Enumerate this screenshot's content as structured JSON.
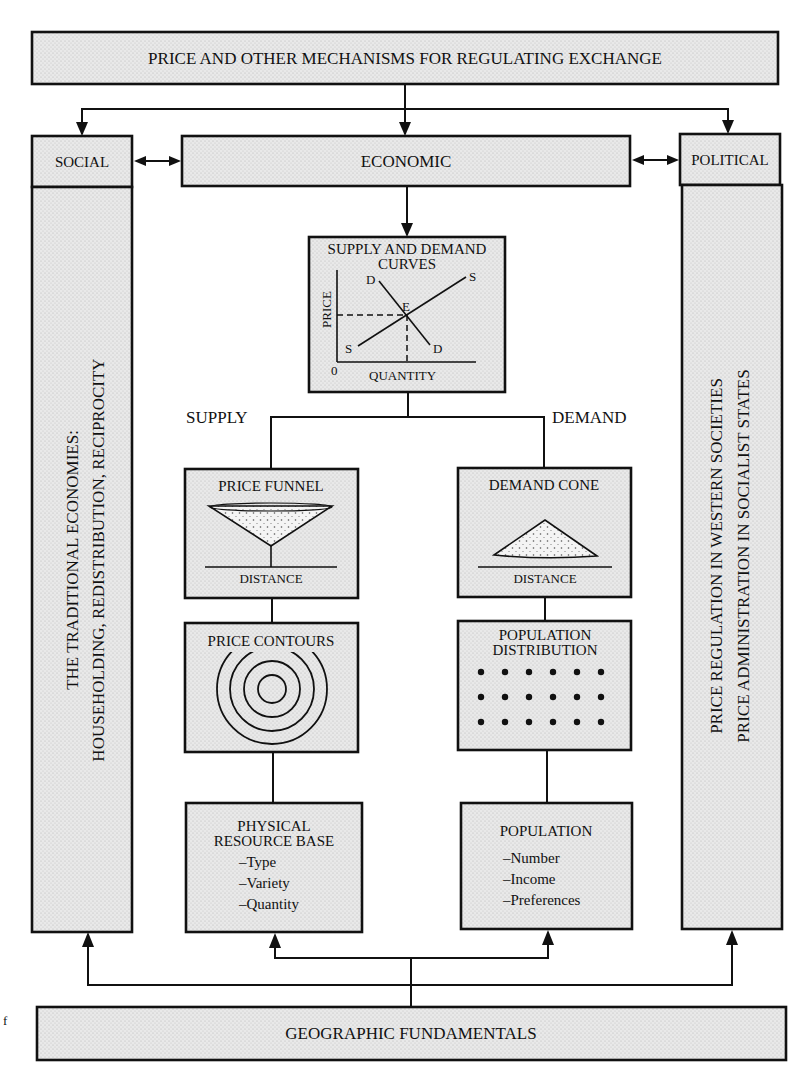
{
  "top_box": {
    "label": "PRICE AND OTHER MECHANISMS FOR REGULATING EXCHANGE"
  },
  "social": {
    "header": "SOCIAL",
    "body_line1": "THE TRADITIONAL ECONOMIES:",
    "body_line2": "HOUSEHOLDING, REDISTRIBUTION, RECIPROCITY"
  },
  "economic": {
    "label": "ECONOMIC"
  },
  "political": {
    "header": "POLITICAL",
    "body_line1": "PRICE REGULATION IN WESTERN SOCIETIES",
    "body_line2": "PRICE ADMINISTRATION IN SOCIALIST STATES"
  },
  "supply_demand": {
    "title_line1": "SUPPLY AND DEMAND",
    "title_line2": "CURVES",
    "y_axis_label": "PRICE",
    "x_axis_label": "QUANTITY",
    "origin_label": "0",
    "demand_label": "D",
    "supply_label": "S",
    "equilibrium_label": "E"
  },
  "branch_labels": {
    "supply": "SUPPLY",
    "demand": "DEMAND"
  },
  "price_funnel": {
    "title": "PRICE FUNNEL",
    "axis_label": "DISTANCE"
  },
  "demand_cone": {
    "title": "DEMAND CONE",
    "axis_label": "DISTANCE"
  },
  "price_contours": {
    "title": "PRICE CONTOURS",
    "ring_count": 4
  },
  "population_distribution": {
    "title_line1": "POPULATION",
    "title_line2": "DISTRIBUTION",
    "dot_rows": 3,
    "dot_cols": 6
  },
  "physical_resource_base": {
    "title_line1": "PHYSICAL",
    "title_line2": "RESOURCE BASE",
    "items": [
      "–Type",
      "–Variety",
      "–Quantity"
    ]
  },
  "population": {
    "title": "POPULATION",
    "items": [
      "–Number",
      "–Income",
      "–Preferences"
    ]
  },
  "bottom_box": {
    "label": "GEOGRAPHIC FUNDAMENTALS"
  },
  "margin_mark": "f"
}
